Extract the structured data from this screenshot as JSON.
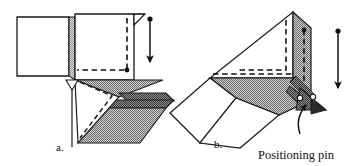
{
  "figure": {
    "title": "",
    "panels": [
      {
        "id": "a",
        "caption": "a.",
        "description": "Sheet metal blank positioned flat with downward forming arrow"
      },
      {
        "id": "b",
        "caption": "b.",
        "description": "Sheet metal blank rotated, folded against tooling with positioning pin"
      }
    ],
    "annotations": [
      {
        "name": "positioning-pin-label",
        "text": "Positioning pin"
      }
    ],
    "arrows": [
      {
        "name": "forming-arrow-a",
        "direction": "down",
        "style": "dot-tail-solid-head"
      },
      {
        "name": "forming-arrow-b",
        "direction": "down",
        "style": "dot-tail-solid-head"
      },
      {
        "name": "pin-leader-arrow",
        "direction": "up",
        "style": "curved-leader"
      }
    ],
    "colors": {
      "outline": "#1a1a1a",
      "fill_white": "#ffffff",
      "fill_light_hatch": "#b9b9b9",
      "fill_mid_hatch": "#9a9a9a",
      "fill_dark_hatch": "#6e6e6e",
      "dashed_line": "#111111",
      "background": "#ffffff"
    }
  }
}
